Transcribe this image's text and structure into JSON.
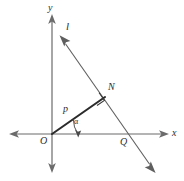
{
  "figure": {
    "kind": "coordinate-geometry-diagram",
    "background_color": "#ffffff",
    "stroke_color": "#5f5f5f",
    "emphasis_color": "#2b2b2b"
  },
  "labels": {
    "y_axis": "y",
    "x_axis": "x",
    "line_l": "l",
    "point_n": "N",
    "point_o": "O",
    "point_q": "Q",
    "segment_p": "p",
    "angle_alpha": "α"
  },
  "geometry": {
    "origin": {
      "x": 52,
      "y": 134
    },
    "y_axis": {
      "x": 52,
      "top_y": 15,
      "bottom_y": 172,
      "arrow_both_ends": true
    },
    "x_axis": {
      "y": 134,
      "left_x": 10,
      "right_x": 168,
      "arrow_both_ends": true
    },
    "line_l": {
      "start": {
        "x": 60,
        "y": 36
      },
      "end": {
        "x": 155,
        "y": 172
      },
      "arrow_both_ends": true
    },
    "point_n": {
      "x": 105,
      "y": 97
    },
    "point_q": {
      "x": 131,
      "y": 134
    },
    "segment_p": {
      "from": {
        "x": 52,
        "y": 134
      },
      "to": {
        "x": 105,
        "y": 97
      }
    },
    "right_angle_marker": {
      "at": "N",
      "size": 9
    },
    "angle_arc": {
      "at": "O",
      "radius": 26,
      "from_deg": 0,
      "to_deg": 35
    }
  }
}
